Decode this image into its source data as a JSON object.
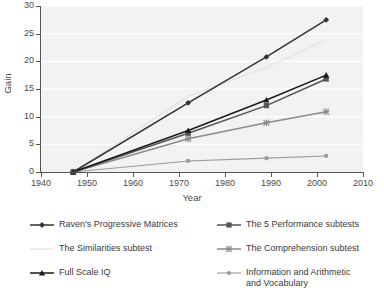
{
  "chart_data": {
    "type": "line",
    "title": "",
    "xlabel": "Year",
    "ylabel": "Gain",
    "xlim": [
      1940,
      2010
    ],
    "ylim": [
      0,
      30
    ],
    "xticks": [
      1940,
      1950,
      1960,
      1970,
      1980,
      1990,
      2000,
      2010
    ],
    "yticks": [
      0,
      5,
      10,
      15,
      20,
      25,
      30
    ],
    "grid": true,
    "grid_axis": "y",
    "legend_position": "below",
    "legend_columns": 2,
    "series": [
      {
        "name": "Raven's Progressive Matrices",
        "marker": "diamond",
        "color": "#333333",
        "x": [
          1947,
          1972,
          1989,
          2002
        ],
        "values": [
          0,
          12.5,
          20.8,
          27.5
        ]
      },
      {
        "name": "The 5 Performance subtests",
        "marker": "square",
        "color": "#555555",
        "x": [
          1947,
          1972,
          1989,
          2002
        ],
        "values": [
          0,
          7.0,
          12.0,
          16.8
        ]
      },
      {
        "name": "The Similarities subtest",
        "marker": "line",
        "color": "#e0e0e0",
        "x": [
          1947,
          1972,
          1989,
          2002
        ],
        "values": [
          0,
          13.7,
          18.9,
          23.9
        ]
      },
      {
        "name": "The Comprehension subtest",
        "marker": "x",
        "color": "#8a8a8a",
        "x": [
          1947,
          1972,
          1989,
          2002
        ],
        "values": [
          0,
          6.0,
          8.9,
          10.9
        ]
      },
      {
        "name": "Full Scale IQ",
        "marker": "triangle",
        "color": "#1a1a1a",
        "x": [
          1947,
          1972,
          1989,
          2002
        ],
        "values": [
          0,
          7.5,
          13.0,
          17.5
        ]
      },
      {
        "name": "Information and Arithmetic\nand Vocabulary",
        "marker": "dot",
        "color": "#9a9a9a",
        "x": [
          1947,
          1972,
          1989,
          2002
        ],
        "values": [
          0,
          2.0,
          2.5,
          2.9
        ]
      }
    ]
  },
  "axes": {
    "y_title": "Gain",
    "x_title": "Year",
    "y_tick_labels": [
      "0",
      "5",
      "10",
      "15",
      "20",
      "25",
      "30"
    ],
    "x_tick_labels": [
      "1940",
      "1950",
      "1960",
      "1970",
      "1980",
      "1990",
      "2000",
      "2010"
    ]
  },
  "legend": {
    "items": [
      {
        "label": "Raven's Progressive Matrices",
        "marker": "diamond",
        "color": "#333333"
      },
      {
        "label": "The 5 Performance subtests",
        "marker": "square",
        "color": "#555555"
      },
      {
        "label": "The Similarities subtest",
        "marker": "line",
        "color": "#e0e0e0"
      },
      {
        "label": "The Comprehension subtest",
        "marker": "x",
        "color": "#8a8a8a"
      },
      {
        "label": "Full Scale IQ",
        "marker": "triangle",
        "color": "#1a1a1a"
      },
      {
        "label": "Information and Arithmetic\nand Vocabulary",
        "marker": "dot",
        "color": "#9a9a9a"
      }
    ]
  },
  "colors": {
    "plot_background": "#f2f2f2",
    "gridline": "#ffffff",
    "axis": "#555555",
    "text": "#3a3a3a"
  }
}
